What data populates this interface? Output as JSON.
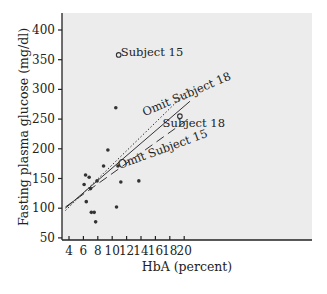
{
  "chart_data": {
    "type": "scatter",
    "title": "",
    "xlabel": "HbA (percent)",
    "ylabel": "Fasting plasma glucose (mg/dl)",
    "xlim": [
      3.5,
      20.8
    ],
    "ylim": [
      45,
      420
    ],
    "xticks": [
      4,
      6,
      8,
      10,
      12,
      14,
      16,
      18,
      20
    ],
    "yticks": [
      50,
      100,
      150,
      200,
      250,
      300,
      350,
      400
    ],
    "grid": false,
    "points": [
      {
        "x": 6.1,
        "y": 140
      },
      {
        "x": 6.3,
        "y": 156
      },
      {
        "x": 6.4,
        "y": 111
      },
      {
        "x": 6.8,
        "y": 152
      },
      {
        "x": 7.0,
        "y": 133
      },
      {
        "x": 7.1,
        "y": 93
      },
      {
        "x": 7.5,
        "y": 93
      },
      {
        "x": 7.7,
        "y": 77
      },
      {
        "x": 7.9,
        "y": 146
      },
      {
        "x": 8.8,
        "y": 171
      },
      {
        "x": 9.4,
        "y": 198
      },
      {
        "x": 10.5,
        "y": 269
      },
      {
        "x": 10.6,
        "y": 102
      },
      {
        "x": 10.8,
        "y": 171
      },
      {
        "x": 11.2,
        "y": 144
      },
      {
        "x": 13.7,
        "y": 146
      }
    ],
    "highlighted_points": [
      {
        "label": "Subject 15",
        "x": 10.9,
        "y": 358
      },
      {
        "label": "Subject 18",
        "x": 19.4,
        "y": 255
      }
    ],
    "lines": [
      {
        "name": "All subjects",
        "style": "solid",
        "x": [
          3.5,
          20.8
        ],
        "y": [
          100,
          280
        ]
      },
      {
        "name": "Omit Subject 18",
        "style": "dotted",
        "x": [
          3.5,
          20.8
        ],
        "y": [
          96,
          301
        ]
      },
      {
        "name": "Omit Subject 15",
        "style": "dashed",
        "x": [
          3.5,
          20.8
        ],
        "y": [
          102,
          252
        ]
      }
    ],
    "annotations": [
      {
        "text": "Subject 15",
        "x": 11.2,
        "y": 356
      },
      {
        "text": "Omit Subject 18",
        "x": 14.5,
        "y": 255,
        "angle": -23
      },
      {
        "text": "Subject 18",
        "x": 17.0,
        "y": 237
      },
      {
        "text": "Omit Subject 15",
        "x": 11.0,
        "y": 166,
        "angle": -20
      }
    ]
  }
}
